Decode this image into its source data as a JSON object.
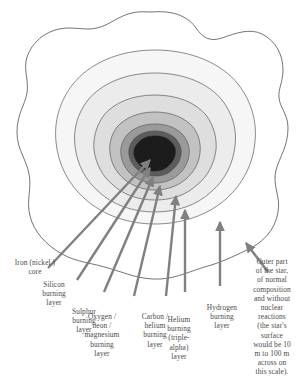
{
  "diagram": {
    "type": "cross-section-shell-diagram",
    "colors": {
      "background": "#ffffff",
      "outline": "#5a5a5a",
      "arrow": "#808080",
      "text": "#4a4a4a",
      "core": "#1c1c1c",
      "shell_1": "#474747",
      "shell_2": "#8c8c8c",
      "shell_3": "#b8b8b8",
      "shell_4": "#d6d6d6",
      "shell_5": "#e8e8e8",
      "shell_6": "#f4f4f4",
      "shell_outer": "#ffffff"
    },
    "shells": [
      {
        "id": "iron-core",
        "label": "Iron (nickel )\ncore",
        "fill": "#1c1c1c"
      },
      {
        "id": "silicon-burning",
        "label": "Silicon\nburning\nlayer",
        "fill": "#474747"
      },
      {
        "id": "sulphur-burning",
        "label": "Sulphur\nburning\nlayer",
        "fill": "#8c8c8c"
      },
      {
        "id": "oxygen-neon-magnesium-burning",
        "label": "Oxygen /\nneon /\nmagnesium\nburning\nlayer",
        "fill": "#b8b8b8"
      },
      {
        "id": "carbon-helium-burning",
        "label": "Carbon /\nhelium\nburning\nlayer",
        "fill": "#d6d6d6"
      },
      {
        "id": "helium-burning-triple-alpha",
        "label": "Helium\nburning\n(triple-\nalpha)\nlayer",
        "fill": "#e8e8e8"
      },
      {
        "id": "hydrogen-burning",
        "label": "Hydrogen\nburning\nlayer",
        "fill": "#f4f4f4"
      },
      {
        "id": "outer-envelope",
        "label": "Outer part\nof the star,\nof normal\ncomposition\nand without\nnuclear\nreactions\n(the star's\nsurface\nwould be 10\nm to 100 m\nacross on\nthis scale).",
        "fill": "#ffffff"
      }
    ]
  }
}
